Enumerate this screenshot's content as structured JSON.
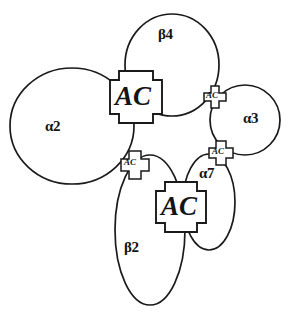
{
  "figure": {
    "title": "",
    "background_color": "#ffffff",
    "stroke_color": "#1a1a1a",
    "width": 286,
    "height": 320
  },
  "subunits": [
    {
      "id": "alpha2",
      "label": "α2",
      "shape": "ellipse",
      "label_x": 45,
      "label_y": 118,
      "cx": 72,
      "cy": 126,
      "rx": 62,
      "ry": 58,
      "rotation": 0
    },
    {
      "id": "beta4",
      "label": "β4",
      "shape": "ellipse",
      "label_x": 158,
      "label_y": 26,
      "cx": 172,
      "cy": 65,
      "rx": 47,
      "ry": 51,
      "rotation": 0
    },
    {
      "id": "alpha3",
      "label": "α3",
      "shape": "ellipse",
      "label_x": 243,
      "label_y": 110,
      "cx": 245,
      "cy": 120,
      "rx": 35,
      "ry": 35,
      "rotation": 0
    },
    {
      "id": "alpha7",
      "label": "α7",
      "shape": "ellipse",
      "label_x": 199,
      "label_y": 165,
      "cx": 209,
      "cy": 202,
      "rx": 26,
      "ry": 48,
      "rotation": 0
    },
    {
      "id": "beta2",
      "label": "β2",
      "shape": "ellipse",
      "label_x": 124,
      "label_y": 239,
      "cx": 150,
      "cy": 230,
      "rx": 35,
      "ry": 75,
      "rotation": 0
    }
  ],
  "binding_sites": [
    {
      "id": "site-top-left",
      "label": "AC",
      "size": "large",
      "cx": 136,
      "cy": 97,
      "half": 26,
      "arm": 9,
      "label_x": 115,
      "label_y": 81
    },
    {
      "id": "site-right-upper",
      "label": "AC",
      "size": "small",
      "cx": 215,
      "cy": 97,
      "half": 11,
      "arm": 4,
      "label_x": 206,
      "label_y": 90
    },
    {
      "id": "site-right-middle",
      "label": "AC",
      "size": "small",
      "cx": 221,
      "cy": 153,
      "half": 12,
      "arm": 4,
      "label_x": 212,
      "label_y": 146
    },
    {
      "id": "site-left-middle",
      "label": "AC",
      "size": "small",
      "cx": 135,
      "cy": 165,
      "half": 14,
      "arm": 5,
      "label_x": 124,
      "label_y": 157
    },
    {
      "id": "site-bottom-center",
      "label": "AC",
      "size": "large",
      "cx": 181,
      "cy": 207,
      "half": 25,
      "arm": 9,
      "label_x": 161,
      "label_y": 191
    }
  ],
  "connectors": [
    {
      "id": "conn-beta4-to-site-right-upper"
    },
    {
      "id": "conn-alpha3-to-site-right-upper"
    },
    {
      "id": "conn-alpha3-to-site-right-middle"
    },
    {
      "id": "conn-alpha7-to-site-right-middle"
    },
    {
      "id": "conn-alpha2-to-site-left-middle"
    },
    {
      "id": "conn-beta2-to-site-left-middle"
    },
    {
      "id": "conn-beta2-to-site-bottom-center"
    },
    {
      "id": "conn-alpha7-to-site-bottom-center"
    },
    {
      "id": "conn-beta4-to-site-top-left"
    },
    {
      "id": "conn-alpha2-to-site-top-left"
    }
  ]
}
